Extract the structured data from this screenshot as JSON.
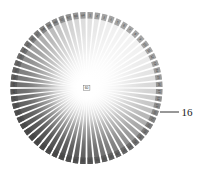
{
  "figure": {
    "background_color": "#ffffff"
  },
  "disc": {
    "center_x": 86.5,
    "center_y": 88.0,
    "radius": 76.0,
    "inner_radius": 2.0,
    "sector_count": 64,
    "gap_degrees": 1.6,
    "tick_ring": {
      "inner_fraction": 0.915,
      "outer_fraction": 1.0,
      "visible": true
    },
    "shading": {
      "type": "angular-and-radial",
      "center_color": "#ffffff",
      "lightest_edge_color": "#f2f2f2",
      "darkest_edge_color": "#4a4a4a",
      "lightest_angle_degrees": 40,
      "darkest_angle_degrees": 220,
      "description": "Brightness falls off from a white center toward the rim; rim darkness varies by angle, lightest toward the upper-right and darkest toward the lower-left."
    }
  },
  "center_label": {
    "text": "60",
    "name": "center-value-label"
  },
  "rim_labels": {
    "visible": true,
    "description": "Tiny rotated numerals printed on each rim tick, running around the full circumference.",
    "values": [
      "1",
      "2",
      "3",
      "4",
      "5",
      "6",
      "7",
      "8",
      "9",
      "10",
      "11",
      "12",
      "13",
      "14",
      "15",
      "16",
      "17",
      "18",
      "19",
      "20",
      "21",
      "22",
      "23",
      "24",
      "25",
      "26",
      "27",
      "28",
      "29",
      "30",
      "31",
      "32",
      "33",
      "34",
      "35",
      "36",
      "37",
      "38",
      "39",
      "40",
      "41",
      "42",
      "43",
      "44",
      "45",
      "46",
      "47",
      "48",
      "49",
      "50",
      "51",
      "52",
      "53",
      "54",
      "55",
      "56",
      "57",
      "58",
      "59",
      "60",
      "61",
      "62",
      "63",
      "64"
    ]
  },
  "callout": {
    "label": "16",
    "leader": {
      "x1": 160.0,
      "y1": 112.0,
      "x2": 179.0,
      "y2": 112.0
    },
    "text_x": 181.5,
    "text_y": 115.5,
    "color": "#1a1a1a"
  },
  "chart_data": {
    "type": "pie",
    "xlabel": "",
    "ylabel": "",
    "categories": [
      "1",
      "2",
      "3",
      "4",
      "5",
      "6",
      "7",
      "8",
      "9",
      "10",
      "11",
      "12",
      "13",
      "14",
      "15",
      "16",
      "17",
      "18",
      "19",
      "20",
      "21",
      "22",
      "23",
      "24",
      "25",
      "26",
      "27",
      "28",
      "29",
      "30",
      "31",
      "32",
      "33",
      "34",
      "35",
      "36",
      "37",
      "38",
      "39",
      "40",
      "41",
      "42",
      "43",
      "44",
      "45",
      "46",
      "47",
      "48",
      "49",
      "50",
      "51",
      "52",
      "53",
      "54",
      "55",
      "56",
      "57",
      "58",
      "59",
      "60",
      "61",
      "62",
      "63",
      "64"
    ],
    "values": [
      1,
      1,
      1,
      1,
      1,
      1,
      1,
      1,
      1,
      1,
      1,
      1,
      1,
      1,
      1,
      1,
      1,
      1,
      1,
      1,
      1,
      1,
      1,
      1,
      1,
      1,
      1,
      1,
      1,
      1,
      1,
      1,
      1,
      1,
      1,
      1,
      1,
      1,
      1,
      1,
      1,
      1,
      1,
      1,
      1,
      1,
      1,
      1,
      1,
      1,
      1,
      1,
      1,
      1,
      1,
      1,
      1,
      1,
      1,
      1,
      1,
      1,
      1,
      1
    ],
    "annotations": [
      "60",
      "16"
    ],
    "legend_position": "none",
    "grid": false
  }
}
